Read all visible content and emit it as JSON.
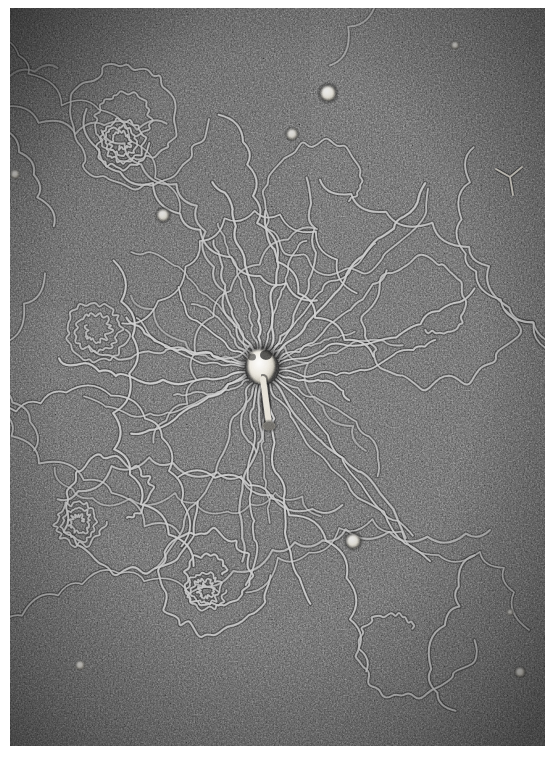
{
  "image": {
    "kind": "electron-micrograph",
    "subject": "Lysed bacteriophage particle with released DNA molecule",
    "modality": "transmission-electron-microscopy",
    "tone": "grayscale",
    "plate": {
      "left": 10,
      "top": 8,
      "width": 535,
      "height": 738,
      "border_color": "#ffffff",
      "background_color": "#595959"
    },
    "palette": {
      "page_white": "#ffffff",
      "film_base": "#5e5e5e",
      "film_dark": "#2b2b2b",
      "film_light": "#8f8f8f",
      "filament_light": "#c9c9c9",
      "filament_core": "#b4b4b4",
      "filament_shadow": "#2e2e2e",
      "blob_white": "#f2f0ea",
      "blob_halo": "#1f1f1f",
      "capsid_white": "#efece4"
    },
    "grain": {
      "description": "fine stipple grain of the carbon support film",
      "cell_px": 3,
      "contrast": "high"
    },
    "vignette": {
      "description": "corners darker than the centre; strongest at upper-left",
      "corner_darkening": 0.45
    }
  },
  "capsid": {
    "name": "bacteriophage-head",
    "center_x": 262,
    "center_y": 368,
    "head_width": 26,
    "head_height": 30,
    "tail_x": 270,
    "tail_y": 412,
    "tail_length": 46,
    "tail_width": 6,
    "baseplate_width": 13,
    "fill": "#efece4",
    "halo": "#1b1b1b"
  },
  "blobs": [
    {
      "name": "stain-blob-top-right",
      "x": 328,
      "y": 93,
      "r": 7.0,
      "halo": 4.5,
      "bright": 0.98
    },
    {
      "name": "stain-blob-upper-mid",
      "x": 292,
      "y": 134,
      "r": 5.0,
      "halo": 3.0,
      "bright": 0.92
    },
    {
      "name": "stain-blob-upper-left",
      "x": 163,
      "y": 215,
      "r": 5.5,
      "halo": 3.5,
      "bright": 0.95
    },
    {
      "name": "stain-blob-left-edge",
      "x": 15,
      "y": 174,
      "r": 4.0,
      "halo": 2.0,
      "bright": 0.9
    },
    {
      "name": "stain-blob-top-far-right",
      "x": 455,
      "y": 45,
      "r": 3.5,
      "halo": 2.0,
      "bright": 0.85
    },
    {
      "name": "stain-blob-lower-mid",
      "x": 353,
      "y": 541,
      "r": 6.5,
      "halo": 4.0,
      "bright": 0.95
    },
    {
      "name": "stain-blob-bottom-left",
      "x": 80,
      "y": 665,
      "r": 4.0,
      "halo": 2.0,
      "bright": 0.92
    },
    {
      "name": "stain-blob-bottom-right",
      "x": 520,
      "y": 672,
      "r": 4.5,
      "halo": 2.5,
      "bright": 0.9
    },
    {
      "name": "stain-blob-right-low",
      "x": 510,
      "y": 612,
      "r": 3.0,
      "halo": 1.5,
      "bright": 0.8
    }
  ],
  "fragments": [
    {
      "name": "y-shaped-fragment-right",
      "x": 510,
      "y": 175,
      "scale": 1.0
    }
  ],
  "radial_fibres": {
    "name": "dna-strands-radiating-from-capsid",
    "count": 34,
    "origin_x": 262,
    "origin_y": 368,
    "inner_radius": 18,
    "reach_min": 70,
    "reach_max": 230,
    "wobble": 0.32,
    "stroke_width": 2.0
  },
  "loops": {
    "name": "dna-loops-and-coils",
    "groups": [
      {
        "label": "upper-left-tangle",
        "cx": 130,
        "cy": 120,
        "r": 70,
        "turns": 2.2
      },
      {
        "label": "upper-left-spiral",
        "cx": 122,
        "cy": 143,
        "r": 26,
        "turns": 3.4
      },
      {
        "label": "upper-right-arc",
        "cx": 330,
        "cy": 190,
        "r": 95,
        "turns": 1.1
      },
      {
        "label": "right-big-loop",
        "cx": 430,
        "cy": 310,
        "r": 85,
        "turns": 1.3
      },
      {
        "label": "left-mid-coil",
        "cx": 95,
        "cy": 330,
        "r": 34,
        "turns": 2.6
      },
      {
        "label": "lower-left-sweep",
        "cx": 120,
        "cy": 500,
        "r": 80,
        "turns": 1.2
      },
      {
        "label": "lower-left-spiral",
        "cx": 78,
        "cy": 522,
        "r": 24,
        "turns": 3.0
      },
      {
        "label": "lower-mid-tangle",
        "cx": 210,
        "cy": 575,
        "r": 62,
        "turns": 2.0
      },
      {
        "label": "lower-mid-spiral",
        "cx": 205,
        "cy": 590,
        "r": 20,
        "turns": 2.8
      },
      {
        "label": "bottom-right-tail",
        "cx": 400,
        "cy": 640,
        "r": 70,
        "turns": 0.9
      }
    ]
  },
  "meta": {
    "width": 555,
    "height": 761,
    "interactable": "false"
  }
}
